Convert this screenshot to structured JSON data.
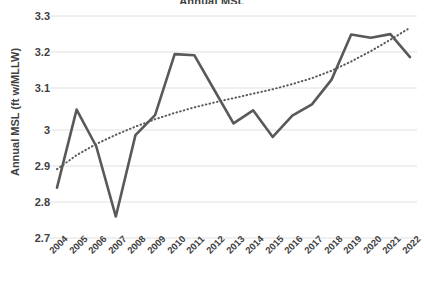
{
  "chart_data": {
    "type": "line",
    "title": "Annual MSL",
    "xlabel": "",
    "ylabel": "Annual MSL (ft w/MLLW)",
    "categories": [
      "2004",
      "2005",
      "2006",
      "2007",
      "2008",
      "2009",
      "2010",
      "2011",
      "2012",
      "2013",
      "2014",
      "2015",
      "2016",
      "2017",
      "2018",
      "2019",
      "2020",
      "2021",
      "2022"
    ],
    "ylim": [
      2.7,
      3.3
    ],
    "yticks": [
      "2.7",
      "2.8",
      "2.9",
      "3",
      "3.1",
      "3.2",
      "3.3"
    ],
    "ytick_values": [
      2.7,
      2.8,
      2.9,
      3.0,
      3.1,
      3.2,
      3.3
    ],
    "grid": true,
    "legend": "none",
    "series": [
      {
        "name": "Annual MSL",
        "style": "solid",
        "color": "#595959",
        "values": [
          2.836,
          3.047,
          2.948,
          2.758,
          2.978,
          3.032,
          3.197,
          3.194,
          3.102,
          3.01,
          3.045,
          2.973,
          3.031,
          3.061,
          3.128,
          3.25,
          3.241,
          3.251,
          3.189
        ]
      },
      {
        "name": "Trendline",
        "style": "dotted",
        "color": "#595959",
        "values": [
          2.886,
          2.924,
          2.954,
          2.979,
          3.001,
          3.021,
          3.038,
          3.053,
          3.066,
          3.078,
          3.09,
          3.102,
          3.116,
          3.132,
          3.152,
          3.177,
          3.205,
          3.236,
          3.268
        ]
      }
    ]
  },
  "axis": {
    "y_label_text": "Annual MSL (ft w/MLLW)"
  }
}
